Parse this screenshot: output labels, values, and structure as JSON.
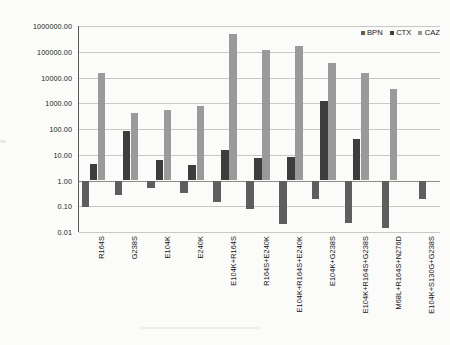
{
  "chart_data": {
    "type": "bar",
    "title": "",
    "subtitle": "",
    "xlabel": "",
    "ylabel": "Relative kcat/KM",
    "ylabel_parts": {
      "prefix": "Relative ",
      "italic1": "k",
      "sub1": "cat",
      "slash": "/",
      "italic2": "K",
      "sub2": "M"
    },
    "yscale": "log",
    "ylim": [
      0.01,
      1000000
    ],
    "ytick_labels": [
      "1000000.00",
      "100000.00",
      "10000.00",
      "1000.00",
      "100.00",
      "10.00",
      "1.00",
      "0.10",
      "0.01"
    ],
    "ytick_values": [
      1000000,
      100000,
      10000,
      1000,
      100,
      10,
      1,
      0.1,
      0.01
    ],
    "grid": true,
    "legend_position": "top-right",
    "baseline": 1.0,
    "categories": [
      "R164S",
      "G238S",
      "E104K",
      "E240K",
      "E104K+R164S",
      "R164S+E240K",
      "E104K+R164S+E240K",
      "E104K+G238S",
      "E104K+R164S+G238S",
      "M68L+R164S+N276D",
      "E104K+S130G+G238S"
    ],
    "series": [
      {
        "name": "BPN",
        "color": "#5e5e5e",
        "values": [
          0.09,
          0.27,
          0.52,
          0.34,
          0.15,
          0.075,
          0.021,
          0.19,
          0.023,
          0.014,
          0.19
        ]
      },
      {
        "name": "CTX",
        "color": "#3d3d3d",
        "values": [
          4.5,
          85,
          6.0,
          4.0,
          15,
          7.5,
          8.0,
          1200,
          42,
          null,
          null
        ]
      },
      {
        "name": "CAZ",
        "color": "#9a9a9a",
        "values": [
          15000,
          430,
          550,
          780,
          500000,
          120000,
          160000,
          38000,
          15000,
          3500,
          null
        ]
      }
    ]
  },
  "legend": {
    "items": [
      {
        "label": "BPN",
        "color": "#5e5e5e"
      },
      {
        "label": "CTX",
        "color": "#3d3d3d"
      },
      {
        "label": "CAZ",
        "color": "#9a9a9a"
      }
    ]
  }
}
